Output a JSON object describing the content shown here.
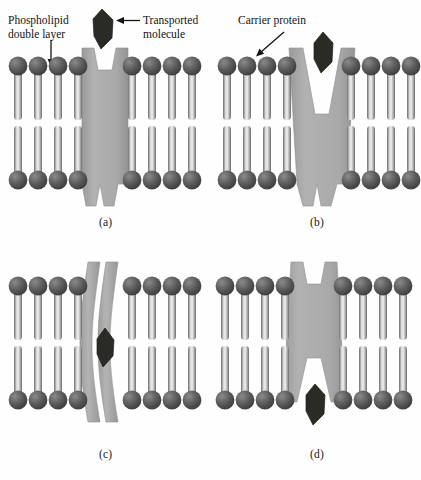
{
  "figure": {
    "background_color": "#fefefe"
  },
  "colors": {
    "protein_fill": "#a8a8a8",
    "protein_edge": "#8f8f8f",
    "head_dark": "#4e4e4e",
    "head_light": "#7c7c7c",
    "tail_dark": "#6f6f6f",
    "tail_light": "#e3e3e3",
    "molecule": "#2b2b26",
    "text": "#141414",
    "arrow": "#141414"
  },
  "annotations": [
    {
      "id": "phospholipid-double-layer",
      "label": "Phospholipid\ndouble layer",
      "x": 8,
      "y": 14,
      "arrow": "down"
    },
    {
      "id": "transported-molecule",
      "label": "Transported\nmolecule",
      "x": 143,
      "y": 14,
      "arrow": "left"
    },
    {
      "id": "carrier-protein",
      "label": "Carrier protein",
      "x": 238,
      "y": 14,
      "arrow": "down-left"
    }
  ],
  "panels": [
    {
      "id": "a",
      "caption": "(a)",
      "state": "Molecule approaching open carrier protein from outside",
      "protein_state": "open-outward",
      "molecule_position": "above-membrane",
      "lipids_left": 4,
      "lipids_right": 4
    },
    {
      "id": "b",
      "caption": "(b)",
      "state": "Molecule binding in the outward-open channel",
      "protein_state": "open-outward-wide",
      "molecule_position": "in-upper-channel",
      "lipids_left": 4,
      "lipids_right": 4
    },
    {
      "id": "c",
      "caption": "(c)",
      "state": "Carrier protein closed around the molecule",
      "protein_state": "occluded-split",
      "molecule_position": "mid-channel",
      "lipids_left": 4,
      "lipids_right": 4
    },
    {
      "id": "d",
      "caption": "(d)",
      "state": "Molecule released to the inside of the cell",
      "protein_state": "open-inward",
      "molecule_position": "below-membrane",
      "lipids_left": 4,
      "lipids_right": 4
    }
  ]
}
